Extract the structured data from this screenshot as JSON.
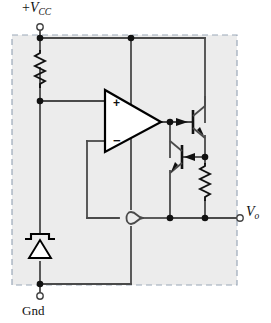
{
  "figure": {
    "kind": "circuit-schematic",
    "canvas": {
      "width": 271,
      "height": 323
    },
    "colors": {
      "wire": "#4a4a4a",
      "device_outline": "#000000",
      "junction": "#111111",
      "region_fill": "#ececec",
      "region_border": "#9aa7b8",
      "background": "#ffffff",
      "text": "#111111"
    }
  },
  "labels": {
    "supply": {
      "sign": "+",
      "symbol": "V",
      "subscript": "CC",
      "text": "+VCC"
    },
    "output": {
      "symbol": "V",
      "subscript": "o",
      "text": "Vo"
    },
    "ground": {
      "text": "Gnd"
    }
  },
  "terminals": [
    {
      "name": "vcc-terminal",
      "label": "+VCC",
      "x": 40,
      "y": 29,
      "style": "open-circle"
    },
    {
      "name": "vo-terminal",
      "label": "Vo",
      "x": 239,
      "y": 214,
      "style": "open-circle"
    },
    {
      "name": "gnd-terminal",
      "label": "Gnd",
      "x": 40,
      "y": 294,
      "style": "open-circle"
    }
  ],
  "components": [
    {
      "name": "series-resistor",
      "type": "resistor",
      "orientation": "vertical",
      "x": 40,
      "y1": 50,
      "y2": 88
    },
    {
      "name": "zener-diode",
      "type": "zener-diode",
      "orientation": "vertical",
      "cathode": "top",
      "x": 40,
      "y1": 234,
      "y2": 262
    },
    {
      "name": "load-resistor",
      "type": "resistor",
      "orientation": "vertical",
      "x": 205,
      "y1": 163,
      "y2": 201
    },
    {
      "name": "op-amp",
      "type": "op-amp",
      "x": 105,
      "y": 90,
      "width": 56,
      "height": 62,
      "plus_input_label": "+",
      "minus_input_label": "−"
    },
    {
      "name": "pass-transistor-q1",
      "type": "npn-transistor",
      "x": 193,
      "y": 122,
      "role": "upper"
    },
    {
      "name": "driver-transistor-q2",
      "type": "npn-transistor",
      "x": 168,
      "y": 157,
      "role": "lower"
    }
  ],
  "junctions": [
    {
      "name": "junction-vcc-top",
      "x": 40,
      "y": 38
    },
    {
      "name": "junction-opamp-supply",
      "x": 131,
      "y": 38
    },
    {
      "name": "junction-zener-reference",
      "x": 40,
      "y": 101
    },
    {
      "name": "junction-opamp-output",
      "x": 170,
      "y": 122
    },
    {
      "name": "junction-q2-collector",
      "x": 205,
      "y": 157
    },
    {
      "name": "junction-output-node",
      "x": 170,
      "y": 218
    },
    {
      "name": "junction-output-rail",
      "x": 205,
      "y": 218
    },
    {
      "name": "junction-gnd",
      "x": 40,
      "y": 284
    }
  ],
  "annotations": {
    "wire_hop": {
      "name": "wire-crossover-hop",
      "x": 131,
      "y": 218,
      "meaning": "no-connection"
    },
    "dashed_region": {
      "name": "ic-boundary",
      "x": 12,
      "y": 35,
      "width": 225,
      "height": 250
    }
  }
}
